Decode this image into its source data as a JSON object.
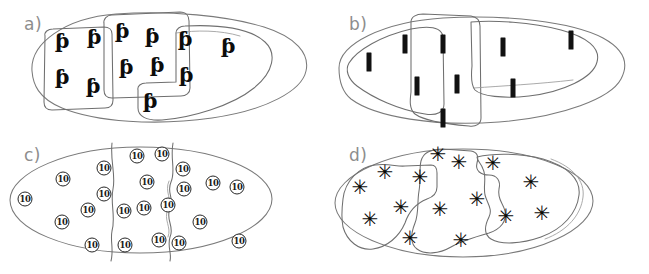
{
  "figure": {
    "background_color": "#ffffff",
    "ink_color": "#6f6f6f",
    "symbol_color": "#0c0c0c",
    "label_color": "#8d8d8d",
    "width": 649,
    "height": 274
  },
  "panels": [
    {
      "id": "a",
      "label": "a)",
      "symbol_name": "g-hook-glyph",
      "symbol_char": "ƥ",
      "symbol_count": 12,
      "region_count": 3,
      "region_shape": "rounded-rectangle-blob",
      "outline_shape": "ellipse",
      "symbols": [
        {
          "x": 62,
          "y": 40
        },
        {
          "x": 94,
          "y": 36
        },
        {
          "x": 122,
          "y": 30
        },
        {
          "x": 152,
          "y": 35
        },
        {
          "x": 185,
          "y": 38
        },
        {
          "x": 228,
          "y": 45
        },
        {
          "x": 62,
          "y": 76
        },
        {
          "x": 93,
          "y": 85
        },
        {
          "x": 126,
          "y": 66
        },
        {
          "x": 157,
          "y": 64
        },
        {
          "x": 186,
          "y": 74
        },
        {
          "x": 150,
          "y": 100
        }
      ]
    },
    {
      "id": "b",
      "label": "b)",
      "symbol_name": "vertical-bar-glyph",
      "symbol_char": "▐",
      "symbol_count": 9,
      "region_count": 3,
      "region_shape": "irregular-blob",
      "outline_shape": "ellipse",
      "symbols": [
        {
          "x": 44,
          "y": 62
        },
        {
          "x": 80,
          "y": 44
        },
        {
          "x": 118,
          "y": 44
        },
        {
          "x": 178,
          "y": 47
        },
        {
          "x": 246,
          "y": 40
        },
        {
          "x": 92,
          "y": 86
        },
        {
          "x": 132,
          "y": 84
        },
        {
          "x": 188,
          "y": 88
        },
        {
          "x": 118,
          "y": 118
        }
      ]
    },
    {
      "id": "c",
      "label": "c)",
      "symbol_name": "circled-ten-token",
      "symbol_char": "10",
      "symbol_count": 22,
      "region_count": 3,
      "region_shape": "vertical-wavy-division",
      "outline_shape": "ellipse",
      "symbols": [
        {
          "x": 25,
          "y": 62
        },
        {
          "x": 63,
          "y": 42
        },
        {
          "x": 104,
          "y": 31
        },
        {
          "x": 104,
          "y": 57
        },
        {
          "x": 88,
          "y": 73
        },
        {
          "x": 62,
          "y": 85
        },
        {
          "x": 92,
          "y": 108
        },
        {
          "x": 137,
          "y": 19
        },
        {
          "x": 162,
          "y": 17
        },
        {
          "x": 147,
          "y": 45
        },
        {
          "x": 124,
          "y": 74
        },
        {
          "x": 144,
          "y": 71
        },
        {
          "x": 125,
          "y": 108
        },
        {
          "x": 168,
          "y": 68
        },
        {
          "x": 159,
          "y": 103
        },
        {
          "x": 179,
          "y": 106
        },
        {
          "x": 183,
          "y": 32
        },
        {
          "x": 184,
          "y": 52
        },
        {
          "x": 213,
          "y": 46
        },
        {
          "x": 237,
          "y": 50
        },
        {
          "x": 200,
          "y": 85
        },
        {
          "x": 239,
          "y": 104
        }
      ]
    },
    {
      "id": "d",
      "label": "d)",
      "symbol_name": "asterisk-flower-glyph",
      "symbol_char": "✳",
      "symbol_count": 17,
      "region_count": 3,
      "region_shape": "irregular-lobed-blob",
      "outline_shape": "ellipse",
      "symbols": [
        {
          "x": 35,
          "y": 50
        },
        {
          "x": 60,
          "y": 35
        },
        {
          "x": 95,
          "y": 40
        },
        {
          "x": 113,
          "y": 17
        },
        {
          "x": 134,
          "y": 25
        },
        {
          "x": 168,
          "y": 26
        },
        {
          "x": 206,
          "y": 45
        },
        {
          "x": 45,
          "y": 82
        },
        {
          "x": 76,
          "y": 70
        },
        {
          "x": 115,
          "y": 72
        },
        {
          "x": 149,
          "y": 59
        },
        {
          "x": 152,
          "y": 69
        },
        {
          "x": 181,
          "y": 79
        },
        {
          "x": 217,
          "y": 76
        },
        {
          "x": 85,
          "y": 101
        },
        {
          "x": 136,
          "y": 103
        },
        {
          "x": 152,
          "y": 78
        }
      ]
    }
  ]
}
